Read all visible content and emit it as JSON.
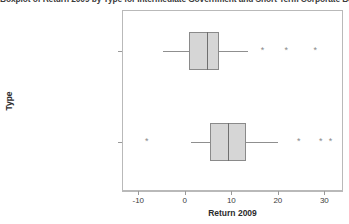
{
  "chart_data": {
    "type": "box",
    "title": "Boxplot of Return 2009 by Type for Intermediate Government and Short Term Corporate Bond Funds",
    "xlabel": "Return 2009",
    "ylabel": "Type",
    "xlim": [
      -13.5,
      34.0
    ],
    "xticks": [
      -10,
      0,
      10,
      20,
      30
    ],
    "xtick_labels": [
      "-10",
      "0",
      "10",
      "20",
      "30"
    ],
    "categories": [
      "Intermediate Government",
      "Short Term Corporate"
    ],
    "grid": false,
    "legend": "none",
    "orientation": "horizontal",
    "boxes": [
      {
        "category": "Intermediate Government",
        "whisker_low": -4.9,
        "q1": 0.6,
        "median": 4.5,
        "q3": 7.2,
        "whisker_high": 13.4,
        "outliers": [
          16.5,
          21.6,
          27.8
        ]
      },
      {
        "category": "Short Term Corporate",
        "whisker_low": 1.2,
        "q1": 5.3,
        "median": 9.1,
        "q3": 13.0,
        "whisker_high": 19.8,
        "outliers": [
          -8.4,
          24.3,
          29.0,
          31.1
        ]
      }
    ],
    "colors": {
      "box_fill": "#d6d6d6",
      "box_edge": "#8a8a8a",
      "median": "#6f6f6f",
      "whisker": "#8f8f8f",
      "outlier": "#8a8a8a",
      "frame": "#b9b9b9",
      "background": "#ffffff"
    },
    "outlier_marker": "*"
  }
}
